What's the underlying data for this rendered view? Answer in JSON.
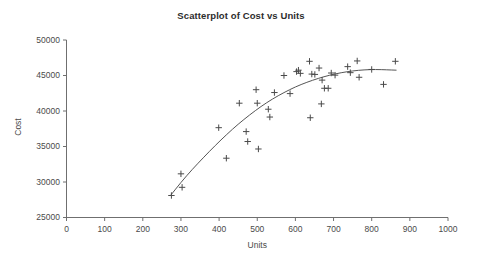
{
  "chart_data": {
    "type": "scatter",
    "title": "Scatterplot of Cost vs Units",
    "xlabel": "Units",
    "ylabel": "Cost",
    "xlim": [
      0,
      1000
    ],
    "ylim": [
      25000,
      50000
    ],
    "xticks": [
      0,
      100,
      200,
      300,
      400,
      500,
      600,
      700,
      800,
      900,
      1000
    ],
    "yticks": [
      25000,
      30000,
      35000,
      40000,
      45000,
      50000
    ],
    "xtick_labels": [
      "0",
      "100",
      "200",
      "300",
      "400",
      "500",
      "600",
      "700",
      "800",
      "900",
      "1000"
    ],
    "ytick_labels": [
      "25000",
      "30000",
      "35000",
      "40000",
      "45000",
      "50000"
    ],
    "grid": false,
    "legend": "none",
    "marker": "plus",
    "marker_color": "#4a4a4a",
    "fit_line_color": "#555555",
    "fit_line_label": "quadratic trend line",
    "points": [
      [
        275,
        28100
      ],
      [
        300,
        31150
      ],
      [
        303,
        29250
      ],
      [
        399,
        37650
      ],
      [
        419,
        33350
      ],
      [
        453,
        41100
      ],
      [
        471,
        37100
      ],
      [
        475,
        35700
      ],
      [
        497,
        43000
      ],
      [
        500,
        41100
      ],
      [
        503,
        34650
      ],
      [
        529,
        40250
      ],
      [
        533,
        39150
      ],
      [
        545,
        42600
      ],
      [
        570,
        45000
      ],
      [
        586,
        42450
      ],
      [
        603,
        45550
      ],
      [
        608,
        45750
      ],
      [
        613,
        45300
      ],
      [
        637,
        47000
      ],
      [
        639,
        39050
      ],
      [
        643,
        45200
      ],
      [
        651,
        45150
      ],
      [
        662,
        46050
      ],
      [
        668,
        41000
      ],
      [
        670,
        44350
      ],
      [
        676,
        43200
      ],
      [
        686,
        43200
      ],
      [
        694,
        45350
      ],
      [
        704,
        45050
      ],
      [
        737,
        46250
      ],
      [
        744,
        45400
      ],
      [
        762,
        47050
      ],
      [
        767,
        44750
      ],
      [
        800,
        45850
      ],
      [
        831,
        43750
      ],
      [
        862,
        47000
      ]
    ],
    "fit_curve": [
      [
        272,
        28050
      ],
      [
        300,
        29950
      ],
      [
        330,
        31800
      ],
      [
        360,
        33500
      ],
      [
        390,
        35150
      ],
      [
        420,
        36700
      ],
      [
        450,
        38150
      ],
      [
        480,
        39450
      ],
      [
        510,
        40650
      ],
      [
        540,
        41700
      ],
      [
        570,
        42600
      ],
      [
        600,
        43400
      ],
      [
        630,
        44050
      ],
      [
        660,
        44600
      ],
      [
        690,
        45050
      ],
      [
        720,
        45400
      ],
      [
        750,
        45650
      ],
      [
        780,
        45800
      ],
      [
        810,
        45850
      ],
      [
        840,
        45800
      ],
      [
        865,
        45750
      ]
    ]
  },
  "axes": {
    "y_axis_title": "Cost",
    "x_axis_title": "Units"
  }
}
